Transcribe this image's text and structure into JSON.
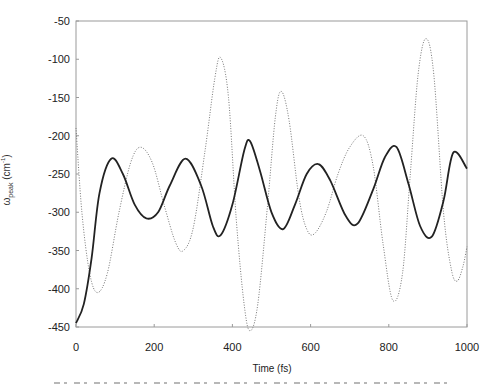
{
  "chart_data": {
    "type": "line",
    "title": "",
    "xlabel": "Time (fs)",
    "ylabel": "ω_peak (cm⁻¹)",
    "xlim": [
      0,
      1000
    ],
    "ylim": [
      -450,
      -50
    ],
    "xticks": [
      0,
      200,
      400,
      600,
      800,
      1000
    ],
    "yticks": [
      -50,
      -100,
      -150,
      -200,
      -250,
      -300,
      -350,
      -400,
      -450
    ],
    "grid": false,
    "legend": null,
    "series": [
      {
        "name": "solid",
        "style": "solid",
        "color": "#222222",
        "x": [
          0,
          20,
          40,
          60,
          90,
          120,
          150,
          180,
          210,
          240,
          280,
          320,
          350,
          370,
          400,
          430,
          445,
          470,
          500,
          530,
          560,
          590,
          620,
          650,
          690,
          720,
          760,
          790,
          820,
          850,
          880,
          910,
          940,
          965,
          1000
        ],
        "y": [
          -445,
          -420,
          -360,
          -275,
          -230,
          -250,
          -290,
          -308,
          -300,
          -265,
          -230,
          -265,
          -318,
          -330,
          -290,
          -220,
          -207,
          -245,
          -300,
          -322,
          -290,
          -250,
          -237,
          -258,
          -305,
          -315,
          -270,
          -228,
          -215,
          -262,
          -318,
          -332,
          -285,
          -222,
          -243
        ]
      },
      {
        "name": "dotted",
        "style": "dotted",
        "color": "#777777",
        "x": [
          0,
          15,
          35,
          55,
          80,
          110,
          140,
          165,
          195,
          225,
          255,
          275,
          300,
          330,
          355,
          370,
          390,
          410,
          430,
          445,
          465,
          490,
          510,
          525,
          545,
          570,
          590,
          610,
          640,
          670,
          700,
          735,
          760,
          785,
          810,
          835,
          855,
          875,
          895,
          915,
          940,
          960,
          975,
          990,
          1000
        ],
        "y": [
          -190,
          -300,
          -380,
          -405,
          -380,
          -300,
          -235,
          -215,
          -235,
          -290,
          -340,
          -350,
          -320,
          -220,
          -125,
          -98,
          -150,
          -310,
          -420,
          -455,
          -420,
          -290,
          -175,
          -142,
          -180,
          -280,
          -322,
          -328,
          -300,
          -250,
          -215,
          -200,
          -240,
          -340,
          -415,
          -380,
          -250,
          -120,
          -73,
          -120,
          -300,
          -375,
          -390,
          -370,
          -345
        ]
      }
    ]
  },
  "axes": {
    "ytick_labels": [
      "-50",
      "-100",
      "-150",
      "-200",
      "-250",
      "-300",
      "-350",
      "-400",
      "-450"
    ],
    "xtick_labels": [
      "0",
      "200",
      "400",
      "600",
      "800",
      "1000"
    ],
    "ylabel_main": "ω",
    "ylabel_sub": "peak",
    "ylabel_unit_open": " (cm",
    "ylabel_sup": "-1",
    "ylabel_unit_close": ")",
    "xlabel": "Time (fs)"
  },
  "colors": {
    "frame": "#9a9a9a",
    "solid_line": "#222222",
    "dotted_line": "#777777"
  }
}
